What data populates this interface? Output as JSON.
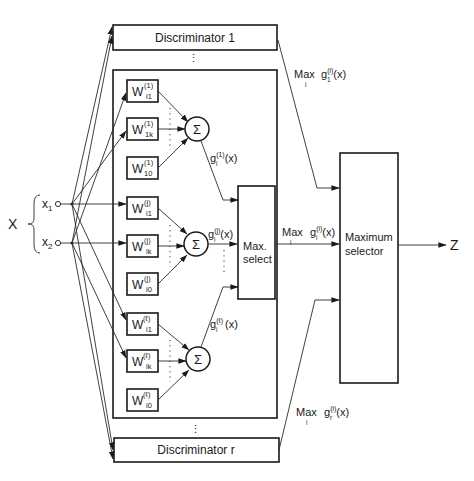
{
  "diagram": {
    "title": "",
    "input": {
      "vector_label": "X",
      "components": [
        {
          "base": "x",
          "sub": "1"
        },
        {
          "base": "x",
          "sub": "2"
        }
      ]
    },
    "discriminators": {
      "first": "Discriminator 1",
      "last": "Discriminator r",
      "ellipsis": "⋮"
    },
    "weight_groups": [
      {
        "superscript": "(1)",
        "weights": [
          {
            "base": "W",
            "sub": "i1",
            "sup": "(1)"
          },
          {
            "base": "W",
            "sub": "1k",
            "sup": "(1)"
          },
          {
            "base": "W",
            "sub": "10",
            "sup": "(1)"
          }
        ],
        "sum_symbol": "Σ",
        "output": {
          "base": "g",
          "sub": "i",
          "sup": "(1)",
          "arg": "(x)"
        }
      },
      {
        "superscript": "(j)",
        "weights": [
          {
            "base": "W",
            "sub": "i1",
            "sup": "(j)"
          },
          {
            "base": "W",
            "sub": "ik",
            "sup": "(j)"
          },
          {
            "base": "W",
            "sub": "i0",
            "sup": "(j)"
          }
        ],
        "sum_symbol": "Σ",
        "output": {
          "base": "g",
          "sub": "i",
          "sup": "(j)",
          "arg": "(x)"
        }
      },
      {
        "superscript": "(ℓ)",
        "weights": [
          {
            "base": "W",
            "sub": "i1",
            "sup": "(ℓ)"
          },
          {
            "base": "W",
            "sub": "ik",
            "sup": "(ℓ)"
          },
          {
            "base": "W",
            "sub": "i0",
            "sup": "(ℓ)"
          }
        ],
        "sum_symbol": "Σ",
        "output": {
          "base": "g",
          "sub": "i",
          "sup": "(ℓ)",
          "arg": "(x)"
        }
      }
    ],
    "max_select": {
      "line1": "Max.",
      "line2": "select"
    },
    "maximum_selector": {
      "line1": "Maximum",
      "line2": "selector"
    },
    "max_labels": [
      {
        "op": "Max",
        "under": "i",
        "base": "g",
        "sub": "1",
        "sup": "(i)",
        "arg": "(x)"
      },
      {
        "op": "Max",
        "under": "i",
        "base": "g",
        "sub": "i",
        "sup": "(i)",
        "arg": "(x)"
      },
      {
        "op": "Max",
        "under": "i",
        "base": "g",
        "sub": "r",
        "sup": "(i)",
        "arg": "(x)"
      }
    ],
    "output_label": "Z"
  }
}
